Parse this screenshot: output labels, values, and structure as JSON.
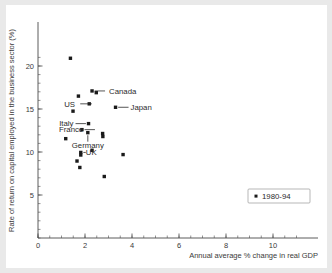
{
  "chart_data": {
    "type": "scatter",
    "title": "",
    "xlabel": "Annual average % change in real GDP",
    "ylabel": "Rate of return on capital employed in the business sector (%)",
    "xlim": [
      0,
      11.2
    ],
    "ylim": [
      0,
      21.8
    ],
    "xticks": [
      0,
      2,
      4,
      6,
      8,
      10
    ],
    "xticklabels": [
      "0",
      "2",
      "4",
      "6",
      "8",
      "10"
    ],
    "yticks": [
      5,
      10,
      15,
      20
    ],
    "yticklabels": [
      "5",
      "10",
      "15",
      "20"
    ],
    "xminor_step": 0.5,
    "yminor_step": 1,
    "grid": false,
    "legend": {
      "position": "lower-right",
      "entries": [
        {
          "label": "1980-94",
          "marker": "square",
          "color": "#1a1a1a"
        }
      ]
    },
    "points": [
      {
        "name": "",
        "x": 1.38,
        "y": 20.9,
        "label": ""
      },
      {
        "name": "Canada",
        "x": 2.3,
        "y": 17.1,
        "label": "Canada",
        "leader": "right"
      },
      {
        "name": "",
        "x": 2.48,
        "y": 16.9,
        "label": ""
      },
      {
        "name": "",
        "x": 1.72,
        "y": 16.5,
        "label": ""
      },
      {
        "name": "US",
        "x": 2.18,
        "y": 15.6,
        "label": "US",
        "leader": "right"
      },
      {
        "name": "Japan",
        "x": 3.3,
        "y": 15.2,
        "label": "Japan",
        "leader": "right"
      },
      {
        "name": "",
        "x": 1.49,
        "y": 14.75,
        "label": ""
      },
      {
        "name": "Italy",
        "x": 2.15,
        "y": 13.3,
        "label": "Italy",
        "leader": "left"
      },
      {
        "name": "France",
        "x": 1.87,
        "y": 12.6,
        "label": "France",
        "leader": "right"
      },
      {
        "name": "Germany",
        "x": 2.12,
        "y": 12.25,
        "label": "Germany",
        "leader": "up"
      },
      {
        "name": "",
        "x": 2.75,
        "y": 12.15,
        "label": ""
      },
      {
        "name": "",
        "x": 2.76,
        "y": 11.8,
        "label": ""
      },
      {
        "name": "",
        "x": 1.18,
        "y": 11.55,
        "label": ""
      },
      {
        "name": "UK",
        "x": 1.82,
        "y": 9.95,
        "label": "UK",
        "leader": "right"
      },
      {
        "name": "",
        "x": 2.3,
        "y": 10.2,
        "label": ""
      },
      {
        "name": "",
        "x": 1.82,
        "y": 9.65,
        "label": ""
      },
      {
        "name": "",
        "x": 1.66,
        "y": 8.95,
        "label": ""
      },
      {
        "name": "",
        "x": 1.78,
        "y": 8.2,
        "label": ""
      },
      {
        "name": "",
        "x": 3.62,
        "y": 9.7,
        "label": ""
      },
      {
        "name": "",
        "x": 2.82,
        "y": 7.15,
        "label": ""
      }
    ]
  }
}
